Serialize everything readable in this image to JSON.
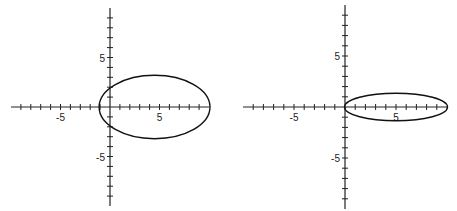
{
  "chart_data": [
    {
      "type": "line",
      "title": "",
      "xlabel": "",
      "ylabel": "",
      "xlim": [
        -10,
        10
      ],
      "ylim": [
        -10,
        10
      ],
      "grid": false,
      "origin_px": [
        110,
        107
      ],
      "unit_px": 9.9,
      "x_tick_labels": [
        "-5",
        "5"
      ],
      "y_tick_labels": [
        "5",
        "-5"
      ],
      "series": [
        {
          "name": "ellipse",
          "shape": "ellipse",
          "center": [
            4.5,
            0
          ],
          "semi_x": 5.6,
          "semi_y": 3.2
        }
      ]
    },
    {
      "type": "line",
      "title": "",
      "xlabel": "",
      "ylabel": "",
      "xlim": [
        -10,
        10
      ],
      "ylim": [
        -10,
        10
      ],
      "grid": false,
      "origin_px": [
        345,
        107
      ],
      "unit_px": 10.2,
      "x_tick_labels": [
        "-5",
        "5"
      ],
      "y_tick_labels": [
        "5",
        "-5"
      ],
      "series": [
        {
          "name": "ellipse",
          "shape": "ellipse",
          "center": [
            5,
            0
          ],
          "semi_x": 5.05,
          "semi_y": 1.35
        }
      ]
    }
  ],
  "labels": {
    "left": {
      "xneg": "-5",
      "xpos": "5",
      "ypos": "5",
      "yneg": "-5"
    },
    "right": {
      "xneg": "-5",
      "xpos": "5",
      "ypos": "5",
      "yneg": "-5"
    }
  }
}
